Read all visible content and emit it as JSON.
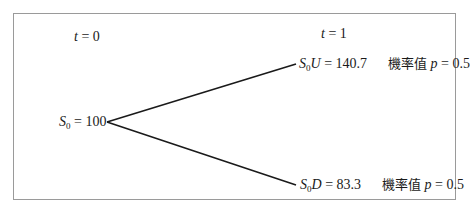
{
  "diagram": {
    "type": "binomial-tree",
    "time_labels": {
      "t0": {
        "var": "t",
        "eq": " = ",
        "val": "0"
      },
      "t1": {
        "var": "t",
        "eq": " = ",
        "val": "1"
      }
    },
    "root": {
      "var": "S",
      "sub": "0",
      "eq": " = ",
      "value": "100"
    },
    "up": {
      "var": "S",
      "sub": "0",
      "suffix": "U",
      "eq": " = ",
      "value": "140.7",
      "prob_label": "機率值",
      "prob_var": "p",
      "prob_eq": " = ",
      "prob_value": "0.5"
    },
    "down": {
      "var": "S",
      "sub": "0",
      "suffix": "D",
      "eq": " = ",
      "value": "83.3",
      "prob_label": "機率值",
      "prob_var": "p",
      "prob_eq": " = ",
      "prob_value": "0.5"
    },
    "colors": {
      "line": "#1a1a1a",
      "frame": "#9a9a9a"
    }
  }
}
